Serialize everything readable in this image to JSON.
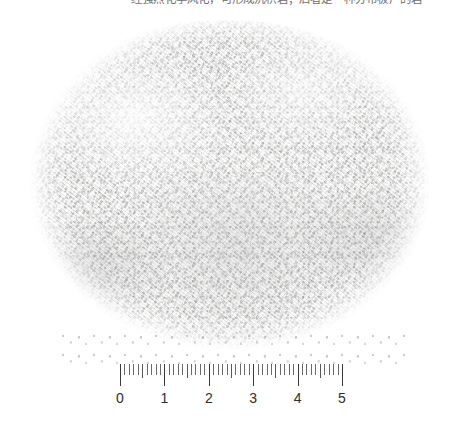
{
  "caption": {
    "text": "经强烈化学风化，可形成沉积岩；后者是一种分布极广的岩"
  },
  "figure": {
    "subject_name": "granular-white-powder-sample",
    "background_color": "#ffffff",
    "sample": {
      "description": "coarse granular white-to-light-gray mineral powder heap",
      "base_color": "#f2f2f1",
      "grain_dark_color": "#8d8d8d",
      "grain_light_color": "#ffffff",
      "bounds": {
        "left": 28,
        "top": 20,
        "width": 404,
        "height": 338
      }
    }
  },
  "ruler": {
    "name": "centimeter-ruler",
    "unit": "cm",
    "min": 0,
    "max": 5,
    "minor_divisions_per_unit": 10,
    "tick_color": "#4a4a4a",
    "label_color": "#2d2d2d",
    "labels": [
      "0",
      "1",
      "2",
      "3",
      "4",
      "5"
    ],
    "geometry": {
      "left": 120,
      "top": 364,
      "length_px": 222,
      "px_per_cm": 44.4
    }
  }
}
